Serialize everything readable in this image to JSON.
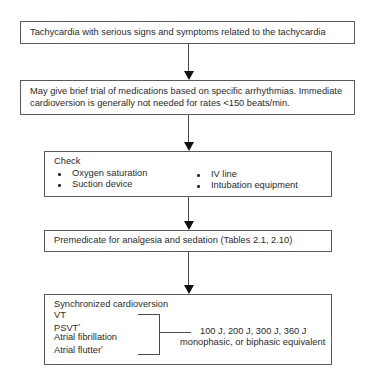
{
  "diagram": {
    "type": "flowchart",
    "nodes": [
      {
        "id": "n1",
        "text": "Tachycardia with serious signs and symptoms related to the tachycardia"
      },
      {
        "id": "n2",
        "lines": [
          "May give brief trial of medications based on specific arrhythmias. Immediate",
          "cardioversion is generally not needed for rates <150 beats/min."
        ]
      },
      {
        "id": "n3",
        "title": "Check",
        "left_items": [
          "Oxygen saturation",
          "Suction device"
        ],
        "right_items": [
          "IV line",
          "Intubation equipment"
        ]
      },
      {
        "id": "n4",
        "text": "Premedicate for analgesia and sedation (Tables 2.1, 2.10)"
      },
      {
        "id": "n5",
        "title": "Synchronized cardioversion",
        "rhythms": [
          {
            "label": "VT",
            "asterisk": ""
          },
          {
            "label": "PSVT",
            "asterisk": "*"
          },
          {
            "label": "Atrial fibrillation",
            "asterisk": ""
          },
          {
            "label": "Atrial flutter",
            "asterisk": "*"
          }
        ],
        "energy_line1": "100 J, 200 J, 300 J, 360 J",
        "energy_line2": "monophasic, or biphasic equivalent"
      }
    ],
    "edges": [
      {
        "from": "n1",
        "to": "n2"
      },
      {
        "from": "n2",
        "to": "n3"
      },
      {
        "from": "n3",
        "to": "n4"
      },
      {
        "from": "n4",
        "to": "n5"
      }
    ]
  }
}
